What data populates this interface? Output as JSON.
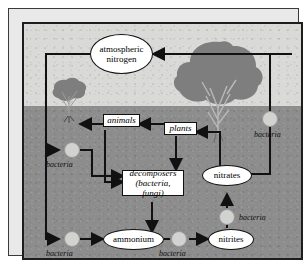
{
  "figure": {
    "background_sky_color": "#d9d9d7",
    "background_soil_color": "#8d8d8d",
    "frame_color": "#1d1d1d",
    "node_fill_color": "#ffffff",
    "bacteria_dot_color": "#d2d2d0",
    "arrow_color": "#111111",
    "tree_color": "#7e7e7e"
  },
  "nodes": {
    "atmospheric_nitrogen": {
      "label_line1": "atmospheric",
      "label_line2": "nitrogen",
      "shape": "ellipse"
    },
    "animals": {
      "label": "animals",
      "shape": "box"
    },
    "plants": {
      "label": "plants",
      "shape": "box"
    },
    "decomposers": {
      "label_line1": "decomposers",
      "label_line2": "(bacteria, fungi)",
      "shape": "box"
    },
    "ammonium": {
      "label": "ammonium",
      "shape": "ellipse"
    },
    "nitrites": {
      "label": "nitrites",
      "shape": "ellipse"
    },
    "nitrates": {
      "label": "nitrates",
      "shape": "ellipse"
    }
  },
  "bacteria_labels": {
    "left_upper": "bacteria",
    "left_lower": "bacteria",
    "bottom_middle": "bacteria",
    "right_middle": "bacteria",
    "right_upper": "bacteria"
  },
  "illustrations": {
    "small_tree": "small-tree",
    "large_tree": "large-tree"
  },
  "flows": [
    {
      "from": "plants",
      "to": "atmospheric nitrogen",
      "via": ""
    },
    {
      "from": "atmospheric nitrogen",
      "to": "bacteria (left upper)",
      "via": ""
    },
    {
      "from": "atmospheric nitrogen",
      "to": "bacteria (left lower)",
      "via": ""
    },
    {
      "from": "atmospheric nitrogen",
      "to": "bacteria (right upper)",
      "via": ""
    },
    {
      "from": "bacteria (right upper)",
      "to": "nitrates",
      "via": ""
    },
    {
      "from": "plants",
      "to": "animals",
      "via": ""
    },
    {
      "from": "plants",
      "to": "decomposers",
      "via": ""
    },
    {
      "from": "animals",
      "to": "small tree",
      "via": ""
    },
    {
      "from": "animals",
      "to": "decomposers",
      "via": ""
    },
    {
      "from": "bacteria (left upper)",
      "to": "decomposers",
      "via": ""
    },
    {
      "from": "decomposers",
      "to": "ammonium",
      "via": ""
    },
    {
      "from": "bacteria (left lower)",
      "to": "ammonium",
      "via": ""
    },
    {
      "from": "ammonium",
      "to": "nitrites",
      "via": "bacteria (bottom middle)"
    },
    {
      "from": "nitrites",
      "to": "nitrates",
      "via": "bacteria (right middle)"
    },
    {
      "from": "nitrates",
      "to": "plants",
      "via": ""
    }
  ]
}
